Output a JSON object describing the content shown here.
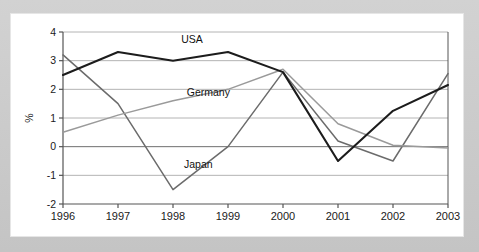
{
  "figure": {
    "background_color": "#c8c8c8",
    "card_color": "#ffffff",
    "axis_color": "#555555",
    "grid_color": "#b4b4b4"
  },
  "chart_data": {
    "type": "line",
    "title": "",
    "xlabel": "",
    "ylabel": "%",
    "categories": [
      1996,
      1997,
      1998,
      1999,
      2000,
      2001,
      2002,
      2003
    ],
    "x_tick_labels": [
      "1996",
      "1997",
      "1998",
      "1999",
      "2000",
      "2001",
      "2002",
      "2003"
    ],
    "y_tick_labels": [
      "-2",
      "-1",
      "0",
      "1",
      "2",
      "3",
      "4"
    ],
    "y_ticks": [
      -2,
      -1,
      0,
      1,
      2,
      3,
      4
    ],
    "ylim": [
      -2,
      4
    ],
    "xlim": [
      1996,
      2003
    ],
    "grid": "horizontal",
    "legend": "inline-labels",
    "series": [
      {
        "name": "USA",
        "color": "#1c1c1c",
        "width": 2.1,
        "label_x": 1998.15,
        "label_y": 3.62,
        "values": [
          2.5,
          3.3,
          3.0,
          3.3,
          2.6,
          -0.5,
          1.25,
          2.15
        ]
      },
      {
        "name": "Germany",
        "color": "#9a9a9a",
        "width": 1.5,
        "label_x": 1998.25,
        "label_y": 1.78,
        "values": [
          0.5,
          1.1,
          1.6,
          2.0,
          2.7,
          0.8,
          0.05,
          -0.05
        ]
      },
      {
        "name": "Japan",
        "color": "#6b6b6b",
        "width": 1.5,
        "label_x": 1998.2,
        "label_y": -0.75,
        "values": [
          3.2,
          1.5,
          -1.5,
          0.0,
          2.6,
          0.2,
          -0.5,
          2.55
        ]
      }
    ]
  }
}
